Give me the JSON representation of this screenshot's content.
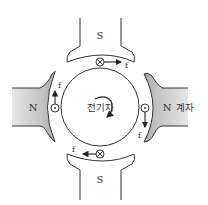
{
  "diagram": {
    "poles": [
      {
        "id": "top",
        "label": "S",
        "fill": "#ffffff"
      },
      {
        "id": "bottom",
        "label": "S",
        "fill": "#ffffff"
      },
      {
        "id": "left",
        "label": "N",
        "fill": "#b8b8b8"
      },
      {
        "id": "right",
        "label": "N",
        "fill": "#b8b8b8"
      }
    ],
    "field_label": "계자",
    "armature_label": "전기자",
    "rotation": "clockwise",
    "conductors": [
      {
        "position": "top",
        "symbol": "⊗",
        "force_label": "f",
        "force_direction": "right"
      },
      {
        "position": "right",
        "symbol": "⊙",
        "force_label": "f",
        "force_direction": "down"
      },
      {
        "position": "bottom",
        "symbol": "⊗",
        "force_label": "f",
        "force_direction": "left"
      },
      {
        "position": "left",
        "symbol": "⊙",
        "force_label": "f",
        "force_direction": "up"
      }
    ],
    "colors": {
      "stroke": "#333333",
      "pole_gray": "#b8b8b8",
      "pole_gray_light": "#e2e2e2",
      "background": "#ffffff"
    }
  }
}
